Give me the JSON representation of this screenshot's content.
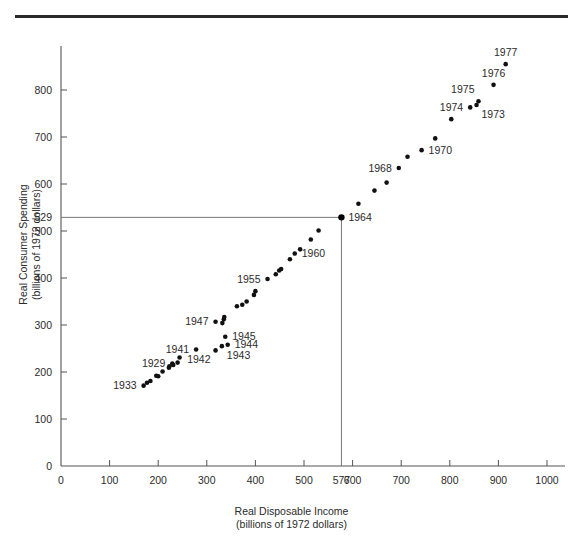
{
  "figure": {
    "has_top_rule": true,
    "background": "#ffffff",
    "point_color": "#111111",
    "axis_color": "#555555",
    "reference_line_color": "#777777"
  },
  "chart_data": {
    "type": "scatter",
    "title": "",
    "xlabel": "Real Disposable Income",
    "xlabel_sub": "(billions of 1972 dollars)",
    "ylabel": "Real Consumer Spending",
    "ylabel_sub": "(billions of 1972 dollars)",
    "xlim": [
      0,
      1000
    ],
    "ylim": [
      0,
      880
    ],
    "grid": false,
    "legend": null,
    "xticks": [
      0,
      100,
      200,
      300,
      400,
      500,
      577,
      600,
      700,
      800,
      900,
      1000
    ],
    "xticklabels": [
      "0",
      "100",
      "200",
      "300",
      "400",
      "500",
      "577",
      "600",
      "700",
      "800",
      "900",
      "1000"
    ],
    "yticks": [
      100,
      200,
      300,
      400,
      500,
      529,
      600,
      700,
      800
    ],
    "yticklabels": [
      "100",
      "200",
      "300",
      "400",
      "500",
      "529",
      "600",
      "700",
      "800"
    ],
    "reference_lines": {
      "x": 577,
      "y": 529,
      "highlight_point": {
        "year": "1964",
        "x": 577,
        "y": 529
      }
    },
    "points": [
      {
        "year": "1929",
        "x": 229,
        "y": 218,
        "label": "1929",
        "label_pos": "left"
      },
      {
        "year": "1930",
        "x": 209,
        "y": 201
      },
      {
        "year": "1931",
        "x": 196,
        "y": 192
      },
      {
        "year": "1932",
        "x": 177,
        "y": 177
      },
      {
        "year": "1933",
        "x": 170,
        "y": 171,
        "label": "1933",
        "label_pos": "left"
      },
      {
        "year": "1934",
        "x": 184,
        "y": 181
      },
      {
        "year": "1935",
        "x": 200,
        "y": 191
      },
      {
        "year": "1936",
        "x": 222,
        "y": 209
      },
      {
        "year": "1937",
        "x": 231,
        "y": 215
      },
      {
        "year": "1938",
        "x": 223,
        "y": 212
      },
      {
        "year": "1939",
        "x": 240,
        "y": 220
      },
      {
        "year": "1940",
        "x": 244,
        "y": 231
      },
      {
        "year": "1941",
        "x": 278,
        "y": 248,
        "label": "1941",
        "label_pos": "left"
      },
      {
        "year": "1942",
        "x": 318,
        "y": 246,
        "label": "1942",
        "label_pos": "below-left"
      },
      {
        "year": "1943",
        "x": 331,
        "y": 255,
        "label": "1943",
        "label_pos": "below-right"
      },
      {
        "year": "1944",
        "x": 343,
        "y": 258,
        "label": "1944",
        "label_pos": "right"
      },
      {
        "year": "1945",
        "x": 338,
        "y": 275,
        "label": "1945",
        "label_pos": "right"
      },
      {
        "year": "1946",
        "x": 332,
        "y": 304
      },
      {
        "year": "1947",
        "x": 318,
        "y": 307,
        "label": "1947",
        "label_pos": "left"
      },
      {
        "year": "1948",
        "x": 335,
        "y": 312
      },
      {
        "year": "1949",
        "x": 336,
        "y": 317
      },
      {
        "year": "1950",
        "x": 362,
        "y": 340
      },
      {
        "year": "1951",
        "x": 373,
        "y": 343
      },
      {
        "year": "1952",
        "x": 382,
        "y": 350
      },
      {
        "year": "1953",
        "x": 397,
        "y": 364
      },
      {
        "year": "1954",
        "x": 400,
        "y": 372
      },
      {
        "year": "1955",
        "x": 425,
        "y": 398,
        "label": "1955",
        "label_pos": "left"
      },
      {
        "year": "1956",
        "x": 442,
        "y": 408
      },
      {
        "year": "1957",
        "x": 449,
        "y": 416
      },
      {
        "year": "1958",
        "x": 453,
        "y": 419
      },
      {
        "year": "1959",
        "x": 471,
        "y": 440
      },
      {
        "year": "1960",
        "x": 481,
        "y": 452,
        "label": "1960",
        "label_pos": "right"
      },
      {
        "year": "1961",
        "x": 492,
        "y": 461
      },
      {
        "year": "1962",
        "x": 514,
        "y": 482
      },
      {
        "year": "1963",
        "x": 530,
        "y": 501
      },
      {
        "year": "1964",
        "x": 577,
        "y": 529,
        "label": "1964",
        "label_pos": "right",
        "highlight": true
      },
      {
        "year": "1965",
        "x": 612,
        "y": 558
      },
      {
        "year": "1966",
        "x": 645,
        "y": 586
      },
      {
        "year": "1967",
        "x": 670,
        "y": 603
      },
      {
        "year": "1968",
        "x": 695,
        "y": 634,
        "label": "1968",
        "label_pos": "left"
      },
      {
        "year": "1969",
        "x": 713,
        "y": 658
      },
      {
        "year": "1970",
        "x": 742,
        "y": 672,
        "label": "1970",
        "label_pos": "right"
      },
      {
        "year": "1971",
        "x": 770,
        "y": 697
      },
      {
        "year": "1972",
        "x": 803,
        "y": 738
      },
      {
        "year": "1973",
        "x": 855,
        "y": 768,
        "label": "1973",
        "label_pos": "below-right"
      },
      {
        "year": "1974",
        "x": 842,
        "y": 763,
        "label": "1974",
        "label_pos": "left"
      },
      {
        "year": "1975",
        "x": 859,
        "y": 776,
        "label": "1975",
        "label_pos": "above-left"
      },
      {
        "year": "1976",
        "x": 890,
        "y": 811,
        "label": "1976",
        "label_pos": "above"
      },
      {
        "year": "1977",
        "x": 915,
        "y": 855,
        "label": "1977",
        "label_pos": "above"
      }
    ]
  }
}
